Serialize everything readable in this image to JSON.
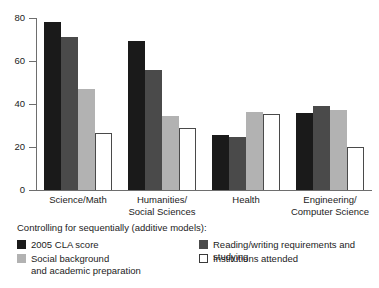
{
  "chart_data": {
    "type": "bar",
    "title": "",
    "xlabel": "",
    "ylabel": "",
    "ylim": [
      0,
      80
    ],
    "yticks": [
      0,
      20,
      40,
      60,
      80
    ],
    "grid": false,
    "legend_position": "below-plot",
    "legend_title": "Controlling for sequentially (additive models):",
    "categories": [
      "Science/Math",
      "Humanities/\nSocial Sciences",
      "Health",
      "Engineering/\nComputer Science"
    ],
    "series": [
      {
        "name": "2005 CLA score",
        "color": "#1a1a1a",
        "values": [
          78,
          69.5,
          25.5,
          36
        ]
      },
      {
        "name": "Reading/writing requirements and studying",
        "color": "#4a4a4a",
        "values": [
          71,
          56,
          24.5,
          39
        ]
      },
      {
        "name": "Social background\nand academic preparation",
        "color": "#b2b2b2",
        "values": [
          47,
          34.5,
          36.5,
          37
        ]
      },
      {
        "name": "Institutions attended",
        "color": "#ffffff",
        "values": [
          26.5,
          29,
          35.5,
          20
        ]
      }
    ]
  },
  "axis": {
    "tick_labels": [
      "80",
      "60",
      "40",
      "20",
      "0"
    ]
  },
  "legend": {
    "title": "Controlling for sequentially (additive models):",
    "items": [
      {
        "label": "2005 CLA score",
        "swatch": "black-swatch"
      },
      {
        "label": "Social background\nand academic preparation",
        "swatch": "light-gray-swatch"
      },
      {
        "label": "Reading/writing requirements and studying",
        "swatch": "dark-gray-swatch"
      },
      {
        "label": "Institutions attended",
        "swatch": "white-swatch"
      }
    ]
  }
}
